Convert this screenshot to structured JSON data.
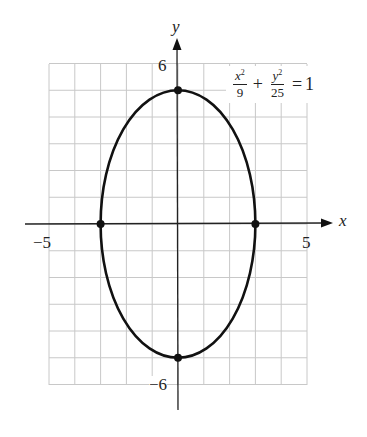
{
  "chart_data": {
    "type": "line",
    "title": "",
    "equation": "x^2/9 + y^2/25 = 1",
    "curve": "ellipse",
    "center": [
      0,
      0
    ],
    "semi_axis_x": 3,
    "semi_axis_y": 5,
    "marked_points": [
      [
        0,
        5
      ],
      [
        0,
        -5
      ],
      [
        -3,
        0
      ],
      [
        3,
        0
      ]
    ],
    "xlabel": "x",
    "ylabel": "y",
    "x_ticks_labeled": [
      -5,
      5
    ],
    "y_ticks_labeled": [
      6,
      -6
    ],
    "xlim": [
      -5,
      5
    ],
    "ylim": [
      -6,
      6
    ],
    "grid": true,
    "grid_step": 1
  },
  "labels": {
    "x_axis": "x",
    "y_axis": "y",
    "x_min": "−5",
    "x_max": "5",
    "y_max": "6",
    "y_min": "−6"
  },
  "equation": {
    "term1_num": "x",
    "term1_exp": "2",
    "term1_den": "9",
    "plus": "+",
    "term2_num": "y",
    "term2_exp": "2",
    "term2_den": "25",
    "equals": "=",
    "rhs": "1"
  },
  "colors": {
    "grid": "#c8c8c8",
    "axis": "#222222",
    "curve": "#111111"
  }
}
